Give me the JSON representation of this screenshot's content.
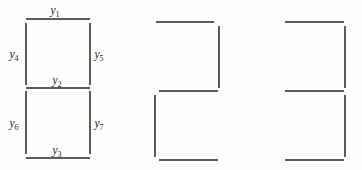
{
  "figure": {
    "caption": "",
    "background_color": "#fdfdfc",
    "line_color": "#26262a",
    "label_color": "#1d1d21",
    "panels": [
      {
        "name": "panel-labeled",
        "index": 1,
        "origin_x": 26,
        "box_width": 64,
        "top_y": 19,
        "mid_y": 88,
        "bottom_y": 158,
        "segments": [
          {
            "id": "top-horizontal",
            "orientation": "horizontal",
            "x1": 26,
            "y1": 19,
            "x2": 90,
            "y2": 19,
            "label": "y1"
          },
          {
            "id": "middle-horizontal",
            "orientation": "horizontal",
            "x1": 26,
            "y1": 88,
            "x2": 90,
            "y2": 88,
            "label": "y2"
          },
          {
            "id": "bottom-horizontal",
            "orientation": "horizontal",
            "x1": 26,
            "y1": 158,
            "x2": 90,
            "y2": 158,
            "label": "y3"
          },
          {
            "id": "upper-left-vertical",
            "orientation": "vertical",
            "x1": 26,
            "y1": 23,
            "x2": 26,
            "y2": 85,
            "label": "y4"
          },
          {
            "id": "upper-right-vertical",
            "orientation": "vertical",
            "x1": 90,
            "y1": 23,
            "x2": 90,
            "y2": 85,
            "label": "y5"
          },
          {
            "id": "lower-left-vertical",
            "orientation": "vertical",
            "x1": 26,
            "y1": 91,
            "x2": 26,
            "y2": 154,
            "label": "y6"
          },
          {
            "id": "lower-right-vertical",
            "orientation": "vertical",
            "x1": 90,
            "y1": 91,
            "x2": 90,
            "y2": 154,
            "label": "y7"
          }
        ],
        "labels": [
          {
            "id": "label-y1",
            "base": "y",
            "sub": "1",
            "x": 55,
            "y": 14,
            "anchor": "middle"
          },
          {
            "id": "label-y2",
            "base": "y",
            "sub": "2",
            "x": 57,
            "y": 84,
            "anchor": "middle"
          },
          {
            "id": "label-y3",
            "base": "y",
            "sub": "3",
            "x": 57,
            "y": 154,
            "anchor": "middle"
          },
          {
            "id": "label-y4",
            "base": "y",
            "sub": "4",
            "x": 14,
            "y": 58,
            "anchor": "middle"
          },
          {
            "id": "label-y5",
            "base": "y",
            "sub": "5",
            "x": 99,
            "y": 58,
            "anchor": "middle"
          },
          {
            "id": "label-y6",
            "base": "y",
            "sub": "6",
            "x": 14,
            "y": 127,
            "anchor": "middle"
          },
          {
            "id": "label-y7",
            "base": "y",
            "sub": "7",
            "x": 99,
            "y": 127,
            "anchor": "middle"
          }
        ]
      },
      {
        "name": "panel-right-left",
        "index": 2,
        "origin_x": 156,
        "box_width": 63,
        "top_y": 22,
        "mid_y": 91,
        "bottom_y": 160,
        "segments": [
          {
            "id": "top-horizontal",
            "orientation": "horizontal",
            "x1": 156,
            "y1": 22,
            "x2": 214,
            "y2": 22,
            "label": ""
          },
          {
            "id": "middle-horizontal",
            "orientation": "horizontal",
            "x1": 159,
            "y1": 91,
            "x2": 218,
            "y2": 91,
            "label": ""
          },
          {
            "id": "bottom-horizontal",
            "orientation": "horizontal",
            "x1": 159,
            "y1": 160,
            "x2": 218,
            "y2": 160,
            "label": ""
          },
          {
            "id": "upper-right-vertical",
            "orientation": "vertical",
            "x1": 219,
            "y1": 26,
            "x2": 219,
            "y2": 88,
            "label": ""
          },
          {
            "id": "lower-left-vertical",
            "orientation": "vertical",
            "x1": 155,
            "y1": 95,
            "x2": 155,
            "y2": 157,
            "label": ""
          }
        ],
        "labels": []
      },
      {
        "name": "panel-right-right",
        "index": 3,
        "origin_x": 285,
        "box_width": 60,
        "top_y": 22,
        "mid_y": 91,
        "bottom_y": 160,
        "segments": [
          {
            "id": "top-horizontal",
            "orientation": "horizontal",
            "x1": 285,
            "y1": 22,
            "x2": 344,
            "y2": 22,
            "label": ""
          },
          {
            "id": "middle-horizontal",
            "orientation": "horizontal",
            "x1": 285,
            "y1": 91,
            "x2": 344,
            "y2": 91,
            "label": ""
          },
          {
            "id": "bottom-horizontal",
            "orientation": "horizontal",
            "x1": 285,
            "y1": 160,
            "x2": 344,
            "y2": 160,
            "label": ""
          },
          {
            "id": "upper-right-vertical",
            "orientation": "vertical",
            "x1": 345,
            "y1": 26,
            "x2": 345,
            "y2": 88,
            "label": ""
          },
          {
            "id": "lower-right-vertical",
            "orientation": "vertical",
            "x1": 345,
            "y1": 95,
            "x2": 345,
            "y2": 157,
            "label": ""
          }
        ],
        "labels": []
      }
    ]
  }
}
